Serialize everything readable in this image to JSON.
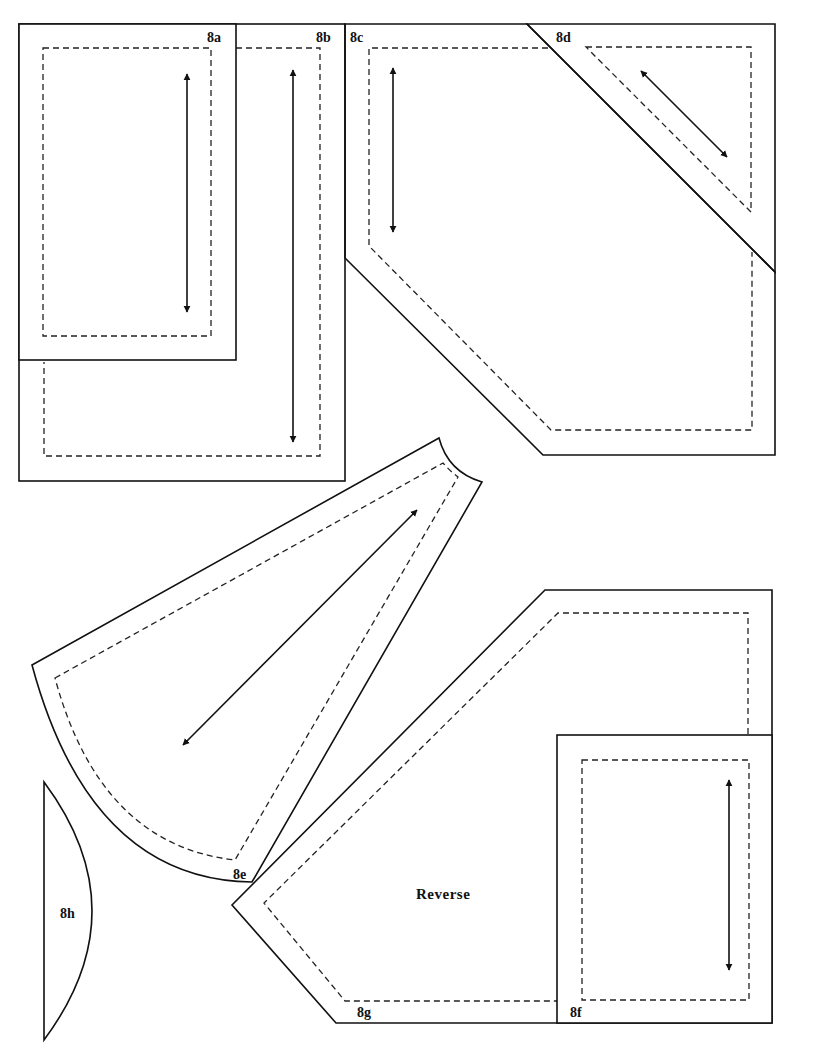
{
  "colors": {
    "line": "#111111",
    "background": "#ffffff"
  },
  "legend": {
    "solid_line": "cutting line",
    "dashed_line": "seam line",
    "double_arrow": "grain line"
  },
  "pieces": [
    {
      "id": "8a",
      "label": "8a",
      "shape": "rectangle"
    },
    {
      "id": "8b",
      "label": "8b",
      "shape": "L-shaped rectangle"
    },
    {
      "id": "8c",
      "label": "8c",
      "shape": "irregular hexagon"
    },
    {
      "id": "8d",
      "label": "8d",
      "shape": "right triangle"
    },
    {
      "id": "8e",
      "label": "8e",
      "shape": "curved wedge"
    },
    {
      "id": "8f",
      "label": "8f",
      "shape": "rectangle"
    },
    {
      "id": "8g",
      "label": "8g",
      "shape": "irregular pentagon",
      "note": "Reverse"
    },
    {
      "id": "8h",
      "label": "8h",
      "shape": "half-lens"
    }
  ],
  "annotations": {
    "reverse": "Reverse"
  }
}
